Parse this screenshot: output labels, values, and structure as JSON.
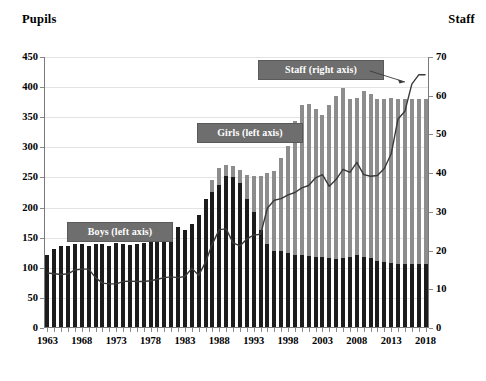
{
  "axis_titles": {
    "left": "Pupils",
    "right": "Staff"
  },
  "callouts": {
    "boys": "Boys (left axis)",
    "girls": "Girls (left axis)",
    "staff": "Staff (right axis)"
  },
  "colors": {
    "boys": "#1c1c1c",
    "girls": "#8d8d8d",
    "staff_line": "#3a3a3a",
    "callout_fill": "#6e6e6e",
    "gridline": "#e3e3e3",
    "axis": "#7a7a7a"
  },
  "chart_data": {
    "type": "bar",
    "title": "",
    "subtitle": "",
    "xlabel": "",
    "ylabel": "Pupils",
    "y2label": "Staff",
    "ylim": [
      0,
      450
    ],
    "y2lim": [
      0,
      70
    ],
    "yticks": [
      0,
      50,
      100,
      150,
      200,
      250,
      300,
      350,
      400,
      450
    ],
    "y2ticks": [
      0,
      10,
      20,
      30,
      40,
      50,
      60,
      70
    ],
    "grid": true,
    "legend_position": "inline-callouts",
    "stacked": true,
    "xticks": [
      1963,
      1968,
      1973,
      1978,
      1983,
      1988,
      1993,
      1998,
      2003,
      2008,
      2013,
      2018
    ],
    "categories": [
      1963,
      1964,
      1965,
      1966,
      1967,
      1968,
      1969,
      1970,
      1971,
      1972,
      1973,
      1974,
      1975,
      1976,
      1977,
      1978,
      1979,
      1980,
      1981,
      1982,
      1983,
      1984,
      1985,
      1986,
      1987,
      1988,
      1989,
      1990,
      1991,
      1992,
      1993,
      1994,
      1995,
      1996,
      1997,
      1998,
      1999,
      2000,
      2001,
      2002,
      2003,
      2004,
      2005,
      2006,
      2007,
      2008,
      2009,
      2010,
      2011,
      2012,
      2013,
      2014,
      2015,
      2016,
      2017,
      2018
    ],
    "series": [
      {
        "name": "Boys (left axis)",
        "axis": "left",
        "color": "#1c1c1c",
        "values": [
          122,
          131,
          136,
          137,
          140,
          140,
          137,
          140,
          140,
          137,
          141,
          139,
          138,
          139,
          141,
          146,
          147,
          143,
          152,
          167,
          162,
          172,
          188,
          215,
          226,
          238,
          252,
          251,
          240,
          214,
          192,
          162,
          140,
          128,
          128,
          124,
          122,
          122,
          120,
          118,
          118,
          116,
          114,
          116,
          118,
          122,
          118,
          116,
          112,
          110,
          108,
          106,
          106,
          106,
          106,
          106
        ]
      },
      {
        "name": "Girls (left axis)",
        "axis": "left",
        "color": "#8d8d8d",
        "values": [
          0,
          0,
          0,
          0,
          0,
          0,
          0,
          0,
          0,
          0,
          0,
          0,
          0,
          0,
          0,
          0,
          0,
          0,
          0,
          0,
          0,
          0,
          0,
          0,
          20,
          28,
          18,
          18,
          22,
          40,
          60,
          90,
          118,
          132,
          154,
          178,
          222,
          248,
          252,
          246,
          235,
          255,
          272,
          282,
          262,
          260,
          276,
          272,
          268,
          270,
          274,
          274,
          274,
          274,
          274,
          274
        ]
      },
      {
        "name": "Total pupils (left axis)",
        "axis": "left",
        "values": [
          122,
          131,
          136,
          137,
          140,
          140,
          137,
          140,
          140,
          137,
          141,
          139,
          138,
          139,
          141,
          146,
          147,
          143,
          152,
          167,
          162,
          172,
          188,
          215,
          246,
          266,
          270,
          269,
          262,
          254,
          252,
          252,
          258,
          260,
          282,
          302,
          344,
          370,
          372,
          364,
          353,
          371,
          386,
          398,
          380,
          382,
          394,
          388,
          380,
          380,
          382,
          380,
          380,
          380,
          380,
          380
        ]
      },
      {
        "name": "Staff (right axis)",
        "axis": "right",
        "color": "#3a3a3a",
        "values": [
          14.2,
          14.0,
          13.8,
          14.0,
          15.0,
          15.2,
          15.2,
          13.0,
          11.6,
          11.4,
          11.4,
          12.0,
          12.1,
          12.0,
          12.0,
          12.2,
          12.6,
          13.0,
          13.2,
          13.0,
          13.3,
          15.4,
          13.6,
          17.0,
          21.8,
          25.4,
          25.6,
          22.0,
          21.2,
          23.0,
          24.0,
          24.2,
          31.0,
          33.0,
          33.4,
          34.4,
          35.0,
          36.2,
          36.8,
          38.8,
          39.6,
          36.6,
          38.4,
          41.0,
          40.2,
          42.8,
          39.6,
          39.2,
          39.4,
          41.2,
          45.0,
          54.0,
          56.0,
          63.0,
          65.4,
          65.4
        ]
      }
    ]
  }
}
